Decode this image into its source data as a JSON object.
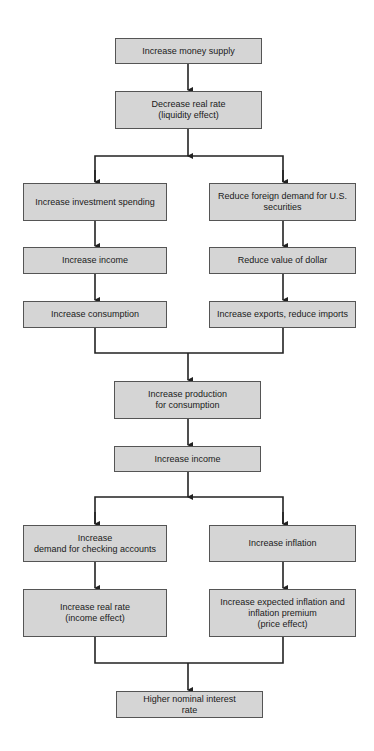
{
  "diagram": {
    "type": "flowchart",
    "nodes": [
      {
        "id": "n1",
        "label": "Increase money supply"
      },
      {
        "id": "n2",
        "label": "Decrease real rate\n(liquidity effect)"
      },
      {
        "id": "n3",
        "label": "Increase investment spending"
      },
      {
        "id": "n4",
        "label": "Reduce foreign demand for U.S.\nsecurities"
      },
      {
        "id": "n5",
        "label": "Increase income"
      },
      {
        "id": "n6",
        "label": "Reduce value of dollar"
      },
      {
        "id": "n7",
        "label": "Increase consumption"
      },
      {
        "id": "n8",
        "label": "Increase exports, reduce imports"
      },
      {
        "id": "n9",
        "label": "Increase production\nfor consumption"
      },
      {
        "id": "n10",
        "label": "Increase income"
      },
      {
        "id": "n11",
        "label": "Increase\ndemand for checking accounts"
      },
      {
        "id": "n12",
        "label": "Increase inflation"
      },
      {
        "id": "n13",
        "label": "Increase real rate\n(income effect)"
      },
      {
        "id": "n14",
        "label": "Increase expected inflation and\ninflation premium\n(price effect)"
      },
      {
        "id": "n15",
        "label": "Higher nominal interest\nrate"
      }
    ],
    "edges": [
      [
        "n1",
        "n2"
      ],
      [
        "n2",
        "n3"
      ],
      [
        "n2",
        "n4"
      ],
      [
        "n3",
        "n5"
      ],
      [
        "n4",
        "n6"
      ],
      [
        "n5",
        "n7"
      ],
      [
        "n6",
        "n8"
      ],
      [
        "n7",
        "n9"
      ],
      [
        "n8",
        "n9"
      ],
      [
        "n9",
        "n10"
      ],
      [
        "n10",
        "n11"
      ],
      [
        "n10",
        "n12"
      ],
      [
        "n11",
        "n13"
      ],
      [
        "n12",
        "n14"
      ],
      [
        "n13",
        "n15"
      ],
      [
        "n14",
        "n15"
      ]
    ]
  }
}
